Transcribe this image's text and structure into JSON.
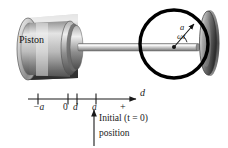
{
  "figure": {
    "background_color": "#ffffff",
    "ink_color": "#1a1a1a",
    "piston": {
      "label": "Piston",
      "body_light": "#f2f2f2",
      "body_mid": "#b8b8b8",
      "body_dark": "#4a4a4a"
    },
    "crank": {
      "circle_color": "#000000",
      "radius_label": "a",
      "angle_label": "ωt",
      "center_dot_color": "#111111"
    },
    "flywheel": {
      "light": "#d8d8d8",
      "dark": "#3c3c3c"
    },
    "rod": {
      "light": "#e6e6e6",
      "dark": "#6e6e6e"
    },
    "axis": {
      "label": "d",
      "line_color": "#1a1a1a",
      "ticks": [
        {
          "id": "neg-a",
          "label": "−a",
          "italic": true
        },
        {
          "id": "zero",
          "label": "0",
          "italic": false
        },
        {
          "id": "d",
          "label": "d",
          "italic": true
        },
        {
          "id": "a",
          "label": "a",
          "italic": true
        },
        {
          "id": "plus",
          "label": "+",
          "italic": false
        }
      ]
    },
    "caption": {
      "line_1": "Initial (t = 0)",
      "line_2": "position"
    }
  }
}
